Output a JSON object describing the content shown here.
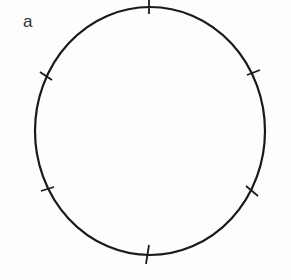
{
  "figure": {
    "label": "a",
    "shape": "circle-with-tick-marks",
    "stroke_color": "#1a1a1a",
    "background": "#fdfdfd",
    "circle": {
      "cx": 150,
      "cy": 131,
      "rx": 115,
      "ry": 124
    },
    "tick_count": 6,
    "ticks": [
      {
        "name": "top",
        "x": 149,
        "y": 7
      },
      {
        "name": "upper-right",
        "x": 254,
        "y": 73
      },
      {
        "name": "lower-right",
        "x": 252,
        "y": 191
      },
      {
        "name": "bottom",
        "x": 147,
        "y": 255
      },
      {
        "name": "lower-left",
        "x": 47,
        "y": 189
      },
      {
        "name": "upper-left",
        "x": 45,
        "y": 76
      }
    ]
  }
}
